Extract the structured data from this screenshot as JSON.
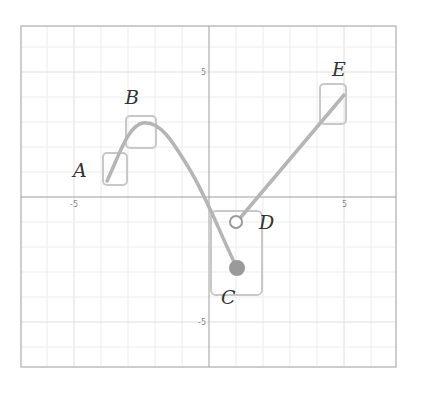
{
  "graph": {
    "x_range": [
      -7,
      7
    ],
    "y_range": [
      -6.8,
      6.8
    ],
    "frame": {
      "left": 21,
      "top": 26,
      "right": 396,
      "bottom": 367
    },
    "origin_px": [
      209,
      197
    ],
    "unit_px": {
      "x": 27,
      "y": 25
    },
    "colors": {
      "frame": "#bdbdbd",
      "grid": "#ececec",
      "axis": "#9e9e9e",
      "curve": "#b5b5b5",
      "box": "#c8c8c8",
      "point": "#9a9a9a",
      "label": "#333333"
    },
    "tick_labels": {
      "x_neg": "-5",
      "x_pos": "5",
      "y_pos": "5",
      "y_neg": "-5"
    }
  },
  "chart_data": {
    "type": "line",
    "title": "",
    "xlabel": "",
    "ylabel": "",
    "xlim": [
      -7,
      7
    ],
    "ylim": [
      -6.8,
      6.8
    ],
    "grid": true,
    "x_ticks": [
      -5,
      5
    ],
    "y_ticks": [
      -5,
      5
    ],
    "series": [
      {
        "name": "curve-1",
        "description": "Smooth curve from A rising to peak at B then descending to C",
        "points": [
          [
            -3.7,
            0.7
          ],
          [
            -3.0,
            2.2
          ],
          [
            -2.5,
            2.8
          ],
          [
            -1.5,
            2.2
          ],
          [
            0.0,
            -0.8
          ],
          [
            1.0,
            -2.9
          ]
        ],
        "end_marker": "filled"
      },
      {
        "name": "line-2",
        "description": "Straight line from D up to E",
        "points": [
          [
            1.2,
            -1.0
          ],
          [
            5.0,
            4.2
          ]
        ],
        "start_marker": "open"
      }
    ],
    "annotations": [
      {
        "label": "A",
        "x": -3.5,
        "y": 1.2
      },
      {
        "label": "B",
        "x": -2.5,
        "y": 2.6
      },
      {
        "label": "C",
        "x": 1.0,
        "y": -2.9
      },
      {
        "label": "D",
        "x": 1.0,
        "y": -1.0
      },
      {
        "label": "E",
        "x": 4.6,
        "y": 3.8
      }
    ]
  },
  "points": {
    "A": {
      "label": "A",
      "label_pos": [
        73,
        177
      ],
      "box": {
        "x": 103,
        "y": 153,
        "w": 24,
        "h": 32
      }
    },
    "B": {
      "label": "B",
      "label_pos": [
        125,
        104
      ],
      "box": {
        "x": 126,
        "y": 116,
        "w": 30,
        "h": 32
      }
    },
    "C": {
      "label": "C",
      "label_pos": [
        221,
        304
      ],
      "box": {
        "x": 211,
        "y": 211,
        "w": 51,
        "h": 84
      },
      "dot": {
        "cx": 237,
        "cy": 268,
        "r": 8
      }
    },
    "D": {
      "label": "D",
      "label_pos": [
        259,
        229
      ],
      "circle": {
        "cx": 236,
        "cy": 222,
        "r": 6
      }
    },
    "E": {
      "label": "E",
      "label_pos": [
        332,
        76
      ],
      "box": {
        "x": 320,
        "y": 84,
        "w": 26,
        "h": 40
      }
    }
  }
}
